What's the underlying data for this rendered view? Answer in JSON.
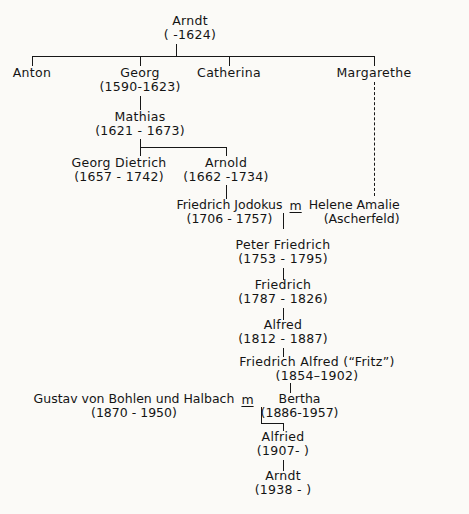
{
  "diagram": {
    "ink_color": "#171717",
    "paper_color": "#fbfaf7"
  },
  "people": {
    "arndt1": {
      "name": "Arndt",
      "dates": "(    -1624)"
    },
    "anton": {
      "name": "Anton",
      "dates": ""
    },
    "georg": {
      "name": "Georg",
      "dates": "(1590-1623)"
    },
    "catherina": {
      "name": "Catherina",
      "dates": ""
    },
    "margarethe": {
      "name": "Margarethe",
      "dates": ""
    },
    "mathias": {
      "name": "Mathias",
      "dates": "(1621  -  1673)"
    },
    "georg_dietrich": {
      "name": "Georg Dietrich",
      "dates": "(1657  -  1742)"
    },
    "arnold": {
      "name": "Arnold",
      "dates": "(1662 -1734)"
    },
    "friedrich_jodokus": {
      "name": "Friedrich Jodokus",
      "dates": "(1706 - 1757)"
    },
    "helene_amalie": {
      "name": "Helene Amalie",
      "dates": "(Ascherfeld)"
    },
    "peter_friedrich": {
      "name": "Peter Friedrich",
      "dates": "(1753   -  1795)"
    },
    "friedrich": {
      "name": "Friedrich",
      "dates": "(1787  -  1826)"
    },
    "alfred": {
      "name": "Alfred",
      "dates": "(1812   -  1887)"
    },
    "friedrich_alfred": {
      "name": "Friedrich Alfred (“Fritz”)",
      "dates": "(1854–1902)"
    },
    "gustav": {
      "name": "Gustav von Bohlen und Halbach",
      "dates": "(1870 - 1950)"
    },
    "bertha": {
      "name": "Bertha",
      "dates": "(1886-1957)"
    },
    "alfried": {
      "name": "Alfried",
      "dates": "(1907-        )"
    },
    "arndt2": {
      "name": "Arndt",
      "dates": "(1938 -      )"
    }
  },
  "marriage_symbol": "m"
}
